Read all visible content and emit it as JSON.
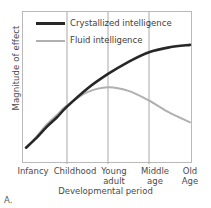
{
  "chart_data": {
    "type": "line",
    "title": "",
    "panel_label": "A.",
    "xlabel": "Developmental period",
    "ylabel": "Magnitude of effect",
    "grid": true,
    "grid_axis": "x",
    "legend_position": "top-left",
    "categories": [
      "Infancy",
      "Childhood",
      "Young adult",
      "Middle age",
      "Old Age"
    ],
    "xlim": [
      0,
      4
    ],
    "ylim": [
      0,
      1
    ],
    "axis_ticks_shown": false,
    "series": [
      {
        "name": "Crystallized intelligence",
        "color": "#272727",
        "width": 2.6,
        "x": [
          0.0,
          0.25,
          0.5,
          0.75,
          1.0,
          1.5,
          2.0,
          2.5,
          3.0,
          3.5,
          4.0
        ],
        "values": [
          0.06,
          0.14,
          0.23,
          0.31,
          0.4,
          0.55,
          0.67,
          0.77,
          0.85,
          0.89,
          0.91
        ]
      },
      {
        "name": "Fluid intelligence",
        "color": "#b0b0b0",
        "width": 2.0,
        "x": [
          0.0,
          0.25,
          0.5,
          0.75,
          1.0,
          1.5,
          2.0,
          2.5,
          3.0,
          3.5,
          4.0
        ],
        "values": [
          0.06,
          0.15,
          0.25,
          0.33,
          0.41,
          0.52,
          0.56,
          0.53,
          0.45,
          0.35,
          0.27
        ]
      }
    ],
    "annotations": [
      "Curves cross near the Childhood gridline",
      "Fluid intelligence peaks at Young adult then declines",
      "Crystallized intelligence rises and plateaus at Old Age"
    ]
  },
  "legend": {
    "items": [
      {
        "label": "Crystallized intelligence",
        "style": "thick",
        "color": "#272727"
      },
      {
        "label": "Fluid intelligence",
        "style": "thin",
        "color": "#b0b0b0"
      }
    ]
  },
  "xticks": [
    {
      "line1": "Infancy",
      "line2": ""
    },
    {
      "line1": "Childhood",
      "line2": ""
    },
    {
      "line1": "Young",
      "line2": "adult"
    },
    {
      "line1": "Middle",
      "line2": "age"
    },
    {
      "line1": "Old",
      "line2": "Age"
    }
  ]
}
